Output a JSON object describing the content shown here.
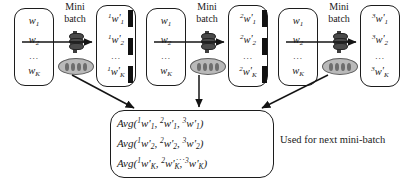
{
  "diagram": {
    "background": "#ffffff",
    "line_color": "#141414",
    "oval_fill": "#b9b9b9",
    "cylinder_fill": "#4a4a4a"
  },
  "groups": [
    {
      "id": "worker-1",
      "minibatch_label_line1": "Mini",
      "minibatch_label_line2": "batch",
      "input_weights": [
        {
          "name": "w",
          "sub": "1",
          "pre": ""
        },
        {
          "name": "w",
          "sub": "2",
          "pre": ""
        },
        {
          "name": "w",
          "sub": "K",
          "pre": ""
        }
      ],
      "input_ellipsis": "...",
      "output_weights": [
        {
          "pre": "1",
          "name": "w",
          "prime": "'",
          "sub": "1"
        },
        {
          "pre": "1",
          "name": "w",
          "prime": "'",
          "sub": "2"
        },
        {
          "pre": "1",
          "name": "w",
          "prime": "'",
          "sub": "K"
        }
      ],
      "output_ellipsis": "..."
    },
    {
      "id": "worker-2",
      "minibatch_label_line1": "Mini",
      "minibatch_label_line2": "batch",
      "input_weights": [
        {
          "name": "w",
          "sub": "1",
          "pre": ""
        },
        {
          "name": "w",
          "sub": "2",
          "pre": ""
        },
        {
          "name": "w",
          "sub": "K",
          "pre": ""
        }
      ],
      "input_ellipsis": "...",
      "output_weights": [
        {
          "pre": "2",
          "name": "w",
          "prime": "'",
          "sub": "1"
        },
        {
          "pre": "2",
          "name": "w",
          "prime": "'",
          "sub": "2"
        },
        {
          "pre": "2",
          "name": "w",
          "prime": "'",
          "sub": "K"
        }
      ],
      "output_ellipsis": "..."
    },
    {
      "id": "worker-3",
      "minibatch_label_line1": "Mini",
      "minibatch_label_line2": "batch",
      "input_weights": [
        {
          "name": "w",
          "sub": "1",
          "pre": ""
        },
        {
          "name": "w",
          "sub": "2",
          "pre": ""
        },
        {
          "name": "w",
          "sub": "K",
          "pre": ""
        }
      ],
      "input_ellipsis": "...",
      "output_weights": [
        {
          "pre": "3",
          "name": "w",
          "prime": "'",
          "sub": "1"
        },
        {
          "pre": "3",
          "name": "w",
          "prime": "'",
          "sub": "2"
        },
        {
          "pre": "3",
          "name": "w",
          "prime": "'",
          "sub": "K"
        }
      ],
      "output_ellipsis": "..."
    }
  ],
  "average_box": {
    "rows": [
      {
        "fn": "Avg(",
        "t1_pre": "1",
        "t1_sub": "1",
        "t2_pre": "2",
        "t2_sub": "1",
        "t3_pre": "3",
        "t3_sub": "1"
      },
      {
        "fn": "Avg(",
        "t1_pre": "1",
        "t1_sub": "2",
        "t2_pre": "2",
        "t2_sub": "2",
        "t3_pre": "3",
        "t3_sub": "2"
      },
      {
        "fn": "Avg(",
        "t1_pre": "1",
        "t1_sub": "K",
        "t2_pre": "2",
        "t2_sub": "K",
        "t3_pre": "3",
        "t3_sub": "K"
      }
    ],
    "ellipsis": "...",
    "caption": "Used for next mini-batch"
  },
  "separators": [
    {
      "id": "separator-1",
      "dashes": 3
    },
    {
      "id": "separator-2",
      "dashes": 3
    }
  ]
}
